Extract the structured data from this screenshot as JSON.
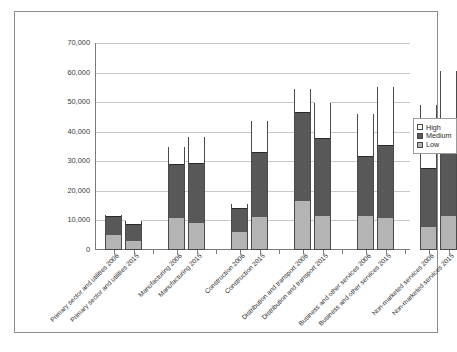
{
  "chart_data": {
    "type": "bar",
    "title": "",
    "subtitle": "",
    "xlabel": "",
    "ylabel": "",
    "stacked": true,
    "grid": true,
    "legend_position": "right",
    "ylim": [
      0,
      70000
    ],
    "ytick_labels": [
      "70,000",
      "60,000",
      "50,000",
      "40,000",
      "30,000",
      "20,000",
      "10,000",
      "0"
    ],
    "ytick_values": [
      70000,
      60000,
      50000,
      40000,
      30000,
      20000,
      10000,
      0
    ],
    "categories": [
      "Primary sector and utilities  2006",
      "Primary sector and utilities  2015",
      "Manufacturing   2006",
      "Manufacturing  2015",
      "Construction   2006",
      "Construction   2015",
      "Distribution and transport   2006",
      "Distribution and transport  2015",
      "Business and other services   2006",
      "Business and other services   2015",
      "Non-marketed services   2006",
      "Non-marketed services  2015"
    ],
    "groups": [
      "Primary sector and utilities",
      "Manufacturing",
      "Construction",
      "Distribution and transport",
      "Business and other services",
      "Non-marketed services"
    ],
    "series": [
      {
        "name": "Low",
        "color": "#b4b4b4",
        "values": [
          4600,
          2700,
          10400,
          8800,
          5900,
          10700,
          16300,
          11300,
          11200,
          10600,
          7300,
          11000
        ]
      },
      {
        "name": "Medium",
        "color": "#585858",
        "values": [
          6400,
          5600,
          18500,
          20400,
          8000,
          22000,
          30200,
          26200,
          20400,
          24700,
          20100,
          23300
        ]
      },
      {
        "name": "High",
        "color": "#ffffff",
        "values": [
          1000,
          1400,
          6100,
          8900,
          1600,
          10800,
          8000,
          12300,
          14500,
          19800,
          21700,
          26400
        ]
      }
    ],
    "totals": [
      12000,
      9700,
      35000,
      38100,
      15500,
      43500,
      54500,
      49800,
      46100,
      55100,
      49100,
      60700
    ]
  },
  "legend": {
    "items": [
      {
        "label": "High"
      },
      {
        "label": "Medium"
      },
      {
        "label": "Low"
      }
    ]
  }
}
